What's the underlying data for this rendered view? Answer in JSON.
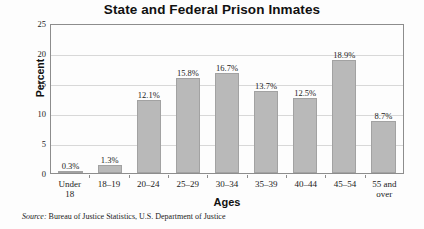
{
  "chart_data": {
    "type": "bar",
    "title": "State and Federal Prison Inmates",
    "xlabel": "Ages",
    "ylabel": "Percent",
    "categories": [
      "Under 18",
      "18–19",
      "20–24",
      "25–29",
      "30–34",
      "35–39",
      "40–44",
      "45–54",
      "55 and over"
    ],
    "category_lines": [
      [
        "Under",
        "18"
      ],
      [
        "18–19"
      ],
      [
        "20–24"
      ],
      [
        "25–29"
      ],
      [
        "30–34"
      ],
      [
        "35–39"
      ],
      [
        "40–44"
      ],
      [
        "45–54"
      ],
      [
        "55 and",
        "over"
      ]
    ],
    "values": [
      0.3,
      1.3,
      12.1,
      15.8,
      16.7,
      13.7,
      12.5,
      18.9,
      8.7
    ],
    "value_labels": [
      "0.3%",
      "1.3%",
      "12.1%",
      "15.8%",
      "16.7%",
      "13.7%",
      "12.5%",
      "18.9%",
      "8.7%"
    ],
    "ylim": [
      0,
      25
    ],
    "yticks": [
      0,
      5,
      10,
      15,
      20,
      25
    ],
    "ytick_labels": [
      "0",
      "5",
      "10",
      "15",
      "20",
      "25"
    ],
    "grid": true,
    "legend": "none",
    "bar_color": "#b9b9b9",
    "bar_border_color": "#a2a2a2",
    "grid_color": "#d8d8d8",
    "axis_color": "#8d8d8d",
    "background_color": "#fdfdfd"
  },
  "source": {
    "lead": "Source:",
    "text": " Bureau of Justice Statistics, U.S. Department of Justice"
  }
}
